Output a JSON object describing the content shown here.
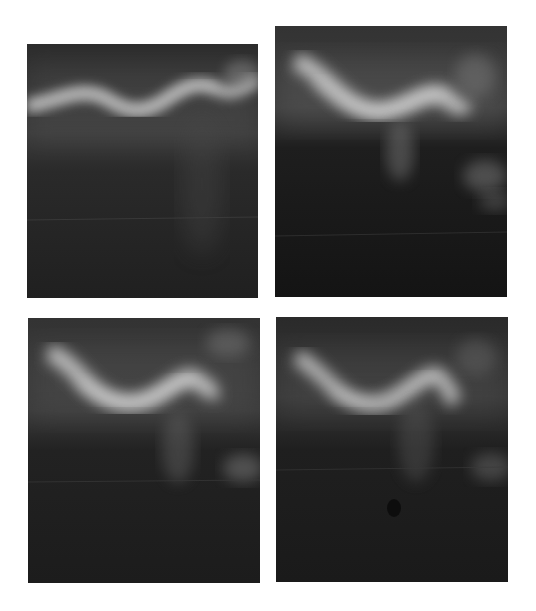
{
  "figure": {
    "layout": "2x2 grid of grayscale radiographic-style images",
    "background_color": "#ffffff",
    "panels": [
      {
        "id": "top-left",
        "x": 27,
        "y": 44,
        "w": 231,
        "h": 254,
        "caption": ""
      },
      {
        "id": "top-right",
        "x": 275,
        "y": 26,
        "w": 232,
        "h": 271,
        "caption": ""
      },
      {
        "id": "bottom-left",
        "x": 28,
        "y": 318,
        "w": 232,
        "h": 265,
        "caption": ""
      },
      {
        "id": "bottom-right",
        "x": 276,
        "y": 317,
        "w": 232,
        "h": 265,
        "caption": ""
      }
    ],
    "colors": {
      "dark": "#1a1a1a",
      "mid": "#3a3a3a",
      "bright": "#d8d8d8"
    }
  }
}
